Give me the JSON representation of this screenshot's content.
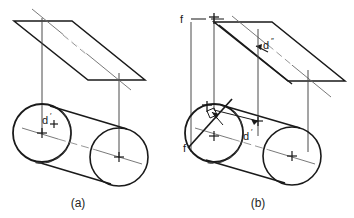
{
  "figure": {
    "background_color": "#ffffff",
    "line_color": "#1a1a1a",
    "thin_line_color": "#5a5a5a",
    "hidden_line_color": "#555555",
    "panels": [
      {
        "id": "a",
        "caption": "(a)",
        "labels": [
          {
            "name": "point-d-prime",
            "base": "d",
            "superscript": "′"
          }
        ]
      },
      {
        "id": "b",
        "caption": "(b)",
        "labels": [
          {
            "name": "frontal-plane-upper",
            "base": "f",
            "superscript": ""
          },
          {
            "name": "frontal-plane-lower",
            "base": "f",
            "superscript": ""
          },
          {
            "name": "point-d-double-prime",
            "base": "d",
            "superscript": "″"
          },
          {
            "name": "point-d-prime",
            "base": "d",
            "superscript": "′"
          }
        ]
      }
    ],
    "markers": {
      "cross": "+",
      "tick": "†"
    }
  },
  "panel_a": {
    "caption": "(a)",
    "label_d_prime": "d",
    "label_d_prime_sup": "′",
    "center_cross_left": "+",
    "center_cross_right": "+"
  },
  "panel_b": {
    "caption": "(b)",
    "label_f_top": "f",
    "label_f_bottom": "f",
    "label_d_double": "d",
    "label_d_double_sup": "″",
    "label_d_prime": "d",
    "label_d_prime_sup": "′",
    "tick_top": "†",
    "tick_tangent": "†",
    "center_cross_left": "+",
    "center_cross_right": "+",
    "cross_upper_arrow": "+",
    "cross_tangent": "+"
  }
}
